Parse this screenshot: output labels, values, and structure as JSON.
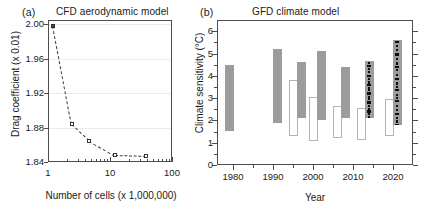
{
  "figure": {
    "width": 436,
    "height": 213,
    "background": "#ffffff"
  },
  "panel_a": {
    "letter": "(a)",
    "title": "CFD aerodynamic model",
    "xlabel": "Number of cells (x 1,000,000)",
    "ylabel": "Drag coefficient (x 0.01)",
    "x_ticklabels": [
      "1",
      "10",
      "100"
    ],
    "y_ticklabels": [
      "1.84",
      "1.88",
      "1.92",
      "1.96",
      "2.00"
    ],
    "colors": {
      "marker_fill": "#ffffff",
      "marker_edge": "#333333",
      "line": "#3a3a3a",
      "grid": "#ebebeb",
      "axis": "#4d4d4d"
    }
  },
  "panel_b": {
    "letter": "(b)",
    "title": "GFD climate model",
    "xlabel": "Year",
    "ylabel": "Climate sensitivity (°C)",
    "x_ticklabels": [
      "1980",
      "1990",
      "2000",
      "2010",
      "2020"
    ],
    "y_ticklabels": [
      "0",
      "1",
      "2",
      "3",
      "4",
      "5",
      "6"
    ],
    "colors": {
      "bar_filled": "#9c9c9c",
      "bar_open_edge": "#b4b4b4",
      "dots": "#0d0d0d",
      "axis": "#4d4d4d"
    }
  },
  "chart_data": [
    {
      "type": "line",
      "panel": "a",
      "title": "CFD aerodynamic model",
      "xlabel": "Number of cells (x 1,000,000)",
      "ylabel": "Drag coefficient (x 0.01)",
      "xscale": "log",
      "xlim": [
        1,
        100
      ],
      "ylim": [
        1.84,
        2.005
      ],
      "xticks": [
        1,
        10,
        100
      ],
      "yticks": [
        1.84,
        1.88,
        1.92,
        1.96,
        2.0
      ],
      "grid": true,
      "linestyle": "dashed",
      "marker": "square-open",
      "x": [
        1.2,
        2.4,
        4.6,
        12.0,
        38.0
      ],
      "y": [
        1.998,
        1.884,
        1.865,
        1.848,
        1.847
      ],
      "legend": null
    },
    {
      "type": "bar",
      "panel": "b",
      "subtype": "floating-range-bars",
      "title": "GFD climate model",
      "xlabel": "Year",
      "ylabel": "Climate sensitivity (°C)",
      "xlim": [
        1976,
        2025
      ],
      "ylim": [
        0,
        6.5
      ],
      "xticks": [
        1980,
        1990,
        2000,
        2010,
        2020
      ],
      "yticks": [
        0,
        1,
        2,
        3,
        4,
        5,
        6
      ],
      "grid": false,
      "legend": null,
      "bars": [
        {
          "year": 1979,
          "low": 1.5,
          "high": 4.5,
          "style": "filled",
          "dots": false
        },
        {
          "year": 1991,
          "low": 1.9,
          "high": 5.2,
          "style": "filled",
          "dots": false
        },
        {
          "year": 1995,
          "low": 1.3,
          "high": 3.8,
          "style": "open",
          "dots": false
        },
        {
          "year": 1997,
          "low": 2.1,
          "high": 4.6,
          "style": "filled",
          "dots": false
        },
        {
          "year": 2000,
          "low": 1.1,
          "high": 3.05,
          "style": "open",
          "dots": false
        },
        {
          "year": 2002,
          "low": 2.0,
          "high": 5.1,
          "style": "filled",
          "dots": false
        },
        {
          "year": 2006,
          "low": 1.2,
          "high": 2.65,
          "style": "open",
          "dots": false
        },
        {
          "year": 2008,
          "low": 2.1,
          "high": 4.4,
          "style": "filled",
          "dots": false
        },
        {
          "year": 2012,
          "low": 1.1,
          "high": 2.55,
          "style": "open",
          "dots": false
        },
        {
          "year": 2014,
          "low": 2.1,
          "high": 4.65,
          "style": "filled",
          "dots": true,
          "dot_values": [
            2.12,
            2.2,
            2.32,
            2.45,
            2.55,
            2.7,
            2.85,
            3.0,
            3.1,
            3.25,
            3.4,
            3.5,
            3.62,
            3.75,
            3.9,
            4.05,
            4.2,
            4.35,
            4.5,
            4.62
          ]
        },
        {
          "year": 2019,
          "low": 1.3,
          "high": 2.95,
          "style": "open",
          "dots": false
        },
        {
          "year": 2021,
          "low": 1.8,
          "high": 5.6,
          "style": "filled",
          "dots": true,
          "dot_values": [
            1.82,
            2.0,
            2.15,
            2.35,
            2.5,
            2.7,
            2.9,
            3.05,
            3.2,
            3.4,
            3.55,
            3.7,
            3.9,
            4.1,
            4.3,
            4.45,
            4.6,
            4.8,
            5.0,
            5.2,
            5.4,
            5.55
          ]
        }
      ]
    }
  ]
}
